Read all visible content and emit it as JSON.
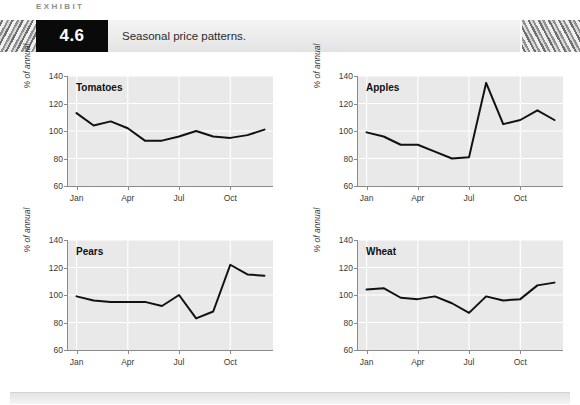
{
  "header": {
    "kicker": "EXHIBIT",
    "number": "4.6",
    "title": "Seasonal price patterns."
  },
  "axis": {
    "ylabel": "% of annual",
    "yticks": [
      "140",
      "120",
      "100",
      "80",
      "60"
    ],
    "xticks": [
      "Jan",
      "Apr",
      "Jul",
      "Oct"
    ]
  },
  "chart_data": [
    {
      "type": "line",
      "title": "Tomatoes",
      "xlabel": "",
      "ylabel": "% of annual",
      "ylim": [
        60,
        140
      ],
      "grid": true,
      "legend": "none",
      "categories": [
        "Jan",
        "Feb",
        "Mar",
        "Apr",
        "May",
        "Jun",
        "Jul",
        "Aug",
        "Sep",
        "Oct",
        "Nov",
        "Dec"
      ],
      "x": [
        1,
        2,
        3,
        4,
        5,
        6,
        7,
        8,
        9,
        10,
        11,
        12
      ],
      "values": [
        113,
        104,
        107,
        102,
        93,
        93,
        96,
        100,
        96,
        95,
        97,
        101
      ]
    },
    {
      "type": "line",
      "title": "Apples",
      "xlabel": "",
      "ylabel": "% of annual",
      "ylim": [
        60,
        140
      ],
      "grid": true,
      "legend": "none",
      "categories": [
        "Jan",
        "Feb",
        "Mar",
        "Apr",
        "May",
        "Jun",
        "Jul",
        "Aug",
        "Sep",
        "Oct",
        "Nov",
        "Dec"
      ],
      "x": [
        1,
        2,
        3,
        4,
        5,
        6,
        7,
        8,
        9,
        10,
        11,
        12
      ],
      "values": [
        99,
        96,
        90,
        90,
        85,
        80,
        81,
        135,
        105,
        108,
        115,
        108
      ]
    },
    {
      "type": "line",
      "title": "Pears",
      "xlabel": "",
      "ylabel": "% of annual",
      "ylim": [
        60,
        140
      ],
      "grid": true,
      "legend": "none",
      "categories": [
        "Jan",
        "Feb",
        "Mar",
        "Apr",
        "May",
        "Jun",
        "Jul",
        "Aug",
        "Sep",
        "Oct",
        "Nov",
        "Dec"
      ],
      "x": [
        1,
        2,
        3,
        4,
        5,
        6,
        7,
        8,
        9,
        10,
        11,
        12
      ],
      "values": [
        99,
        96,
        95,
        95,
        95,
        92,
        100,
        83,
        88,
        122,
        115,
        114
      ]
    },
    {
      "type": "line",
      "title": "Wheat",
      "xlabel": "",
      "ylabel": "% of annual",
      "ylim": [
        60,
        140
      ],
      "grid": true,
      "legend": "none",
      "categories": [
        "Jan",
        "Feb",
        "Mar",
        "Apr",
        "May",
        "Jun",
        "Jul",
        "Aug",
        "Sep",
        "Oct",
        "Nov",
        "Dec"
      ],
      "x": [
        1,
        2,
        3,
        4,
        5,
        6,
        7,
        8,
        9,
        10,
        11,
        12
      ],
      "values": [
        104,
        105,
        98,
        97,
        99,
        94,
        87,
        99,
        96,
        97,
        107,
        109
      ]
    }
  ],
  "colors": {
    "line": "#111111",
    "plot_background": "#e9e9e9",
    "gridline": "#ffffff",
    "number_box": "#0a0a0a"
  }
}
